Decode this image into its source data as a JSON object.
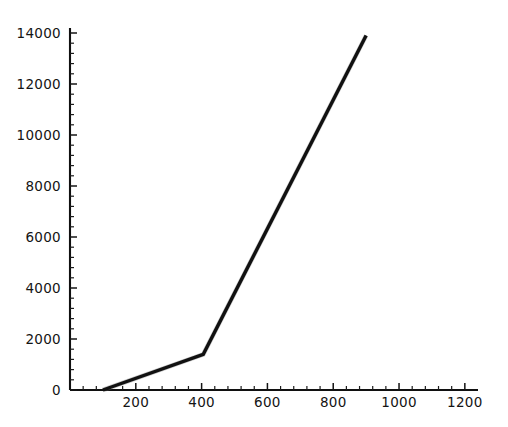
{
  "chart_data": {
    "type": "line",
    "title": "",
    "subtitle": "",
    "xlabel": "",
    "ylabel": "",
    "xlim": [
      0,
      1240
    ],
    "ylim": [
      0,
      14400
    ],
    "grid": false,
    "legend": null,
    "x_ticks_major": [
      200,
      400,
      600,
      800,
      1000,
      1200
    ],
    "x_tick_labels": [
      "200",
      "400",
      "600",
      "800",
      "1000",
      "1200"
    ],
    "x_tick_minor_interval": 40,
    "y_ticks_major": [
      0,
      2000,
      4000,
      6000,
      8000,
      10000,
      12000,
      14000
    ],
    "y_tick_labels": [
      "0",
      "2000",
      "4000",
      "6000",
      "8000",
      "10000",
      "12000",
      "14000"
    ],
    "y_tick_minor_interval": 400,
    "series": [
      {
        "name": "series-1",
        "color": "#111111",
        "x": [
          100,
          405,
          900
        ],
        "values": [
          0,
          1400,
          13900
        ]
      }
    ],
    "annotations": []
  },
  "axes": {
    "style": "left-and-bottom-spines",
    "color": "#101010",
    "x_axis_extends_to": 1240
  }
}
